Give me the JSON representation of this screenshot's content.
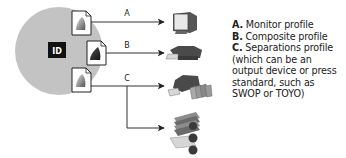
{
  "app_logo": {
    "text": "ID",
    "icon": "indesign-logo-icon"
  },
  "profiles": [
    {
      "key": "A",
      "doc_icon": "color-profile-document-icon",
      "device_icon": "monitor-icon"
    },
    {
      "key": "B",
      "doc_icon": "color-profile-document-icon",
      "device_icon": "desktop-printer-icon"
    },
    {
      "key": "C",
      "doc_icon": "color-profile-document-icon",
      "device_icons": [
        "proof-printer-icon",
        "printing-press-icon"
      ]
    }
  ],
  "legend": {
    "items": [
      {
        "key": "A.",
        "text": " Monitor profile"
      },
      {
        "key": "B.",
        "text": " Composite profile"
      },
      {
        "key": "C.",
        "text": " Separations profile (which can be an output device or press standard, such as SWOP or TOYO)"
      }
    ]
  },
  "colors": {
    "circle": "#c3c3c3",
    "logo_bg": "#111111",
    "line": "#333333",
    "device_dark": "#4a4a4a",
    "device_mid": "#8c8c8c",
    "device_light": "#d6d6d6"
  }
}
